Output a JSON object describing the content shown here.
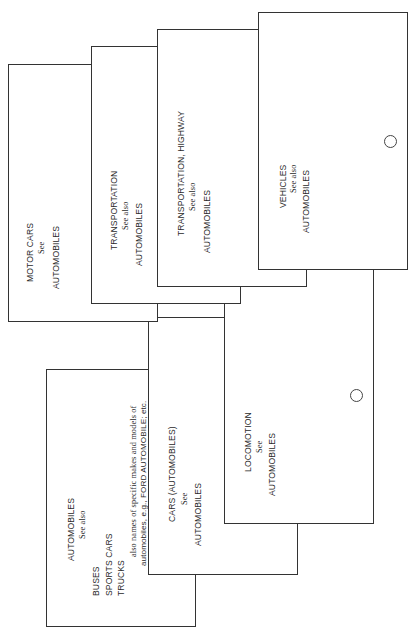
{
  "cards": {
    "automobiles": {
      "heading": "AUTOMOBILES",
      "see_label": "See also",
      "refs": [
        "BUSES",
        "SPORTS CARS",
        "TRUCKS"
      ],
      "note_line1": "also names of specific makes and models of",
      "note_line2": "automobiles, e.g., FORD AUTOMOBILE; etc."
    },
    "cars": {
      "heading": "CARS (AUTOMOBILES)",
      "see_label": "See",
      "ref": "AUTOMOBILES"
    },
    "locomotion": {
      "heading": "LOCOMOTION",
      "see_label": "See",
      "ref": "AUTOMOBILES",
      "has_hole": true
    },
    "motor_cars": {
      "heading": "MOTOR CARS",
      "see_label": "See",
      "ref": "AUTOMOBILES"
    },
    "transportation": {
      "heading": "TRANSPORTATION",
      "see_label": "See also",
      "ref": "AUTOMOBILES"
    },
    "transportation_highway": {
      "heading": "TRANSPORTATION, HIGHWAY",
      "see_label": "See also",
      "ref": "AUTOMOBILES"
    },
    "vehicles": {
      "heading": "VEHICLES",
      "see_label": "See also",
      "ref": "AUTOMOBILES",
      "has_hole": true
    }
  },
  "colors": {
    "border": "#333333",
    "text": "#2a2a2a",
    "background": "#ffffff"
  }
}
